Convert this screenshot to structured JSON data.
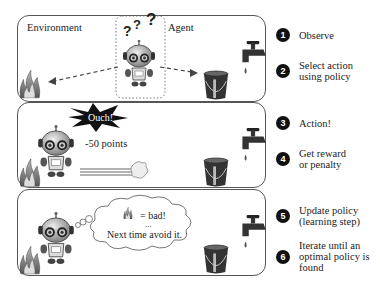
{
  "panel1": {
    "environment_label": "Environment",
    "agent_label": "Agent",
    "question_marks": [
      "?",
      "?",
      "?"
    ]
  },
  "panel2": {
    "burst_text": "Ouch!",
    "penalty_text": "-50 points"
  },
  "panel3": {
    "thought_equals": "= bad!",
    "thought_ellipsis": "...",
    "thought_line": "Next time avoid it."
  },
  "steps": [
    {
      "number": "1",
      "text": "Observe"
    },
    {
      "number": "2",
      "text": "Select action\nusing policy"
    },
    {
      "number": "3",
      "text": "Action!"
    },
    {
      "number": "4",
      "text": "Get reward\nor penalty"
    },
    {
      "number": "5",
      "text": "Update policy\n(learning step)"
    },
    {
      "number": "6",
      "text": "Iterate until an\noptimal policy is\nfound"
    }
  ]
}
